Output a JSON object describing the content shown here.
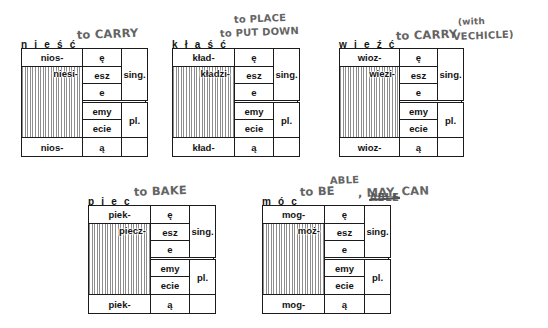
{
  "page": {
    "kind": "handwritten-annotated-grammar-worksheet",
    "language": "Polish",
    "background_color": "#ffffff",
    "ink_color": "#1b1b1b",
    "pencil_color": "#4f4f4f"
  },
  "labels": {
    "singular": "sing.",
    "plural": "pl."
  },
  "verbs": [
    {
      "id": "niesc",
      "headword": "n i e ś ć",
      "gloss_lines": [
        "to CARRY"
      ],
      "stem_top": "nios-",
      "stem_mid": "niesi-",
      "stem_bottom": "nios-",
      "endings": [
        "ę",
        "esz",
        "e",
        "emy",
        "ecie",
        "ą"
      ],
      "number_labels": [
        "sing.",
        "pl."
      ]
    },
    {
      "id": "klasc",
      "headword": "k ł a ś ć",
      "gloss_lines": [
        "to PLACE",
        "to PUT DOWN"
      ],
      "stem_top": "kład-",
      "stem_mid": "kładzi-",
      "stem_bottom": "kład-",
      "endings": [
        "ę",
        "esz",
        "e",
        "emy",
        "ecie",
        "ą"
      ],
      "number_labels": [
        "sing.",
        "pl."
      ]
    },
    {
      "id": "wiezc",
      "headword": "w i e ź ć",
      "gloss_lines": [
        "to CARRY",
        "(with",
        "VECHICLE)"
      ],
      "stem_top": "wioz-",
      "stem_mid": "wiezi-",
      "stem_bottom": "wioz-",
      "endings": [
        "ę",
        "esz",
        "e",
        "emy",
        "ecie",
        "ą"
      ],
      "number_labels": [
        "sing.",
        "pl."
      ]
    },
    {
      "id": "piec",
      "headword": "p i e c",
      "gloss_lines": [
        "to BAKE"
      ],
      "stem_top": "piek-",
      "stem_mid": "piecz-",
      "stem_bottom": "piek-",
      "endings": [
        "ę",
        "esz",
        "e",
        "emy",
        "ecie",
        "ą"
      ],
      "number_labels": [
        "sing.",
        "pl."
      ]
    },
    {
      "id": "moc",
      "headword": "m ó c",
      "gloss_lines": [
        "to BE",
        "ABLE",
        "ABLE",
        ", MAY, CAN"
      ],
      "gloss_note": "the second ABLE is struck out; ABLE rewritten above",
      "stem_top": "mog-",
      "stem_mid": "moż-",
      "stem_bottom": "mog-",
      "endings": [
        "ę",
        "esz",
        "e",
        "emy",
        "ecie",
        "ą"
      ],
      "number_labels": [
        "sing.",
        "pl."
      ]
    }
  ]
}
